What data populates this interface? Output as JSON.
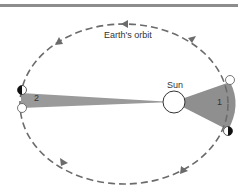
{
  "diagram": {
    "title_rule": true,
    "labels": {
      "orbit": "Earth's orbit",
      "sun": "Sun",
      "area1": "1",
      "area2": "2"
    },
    "colors": {
      "orbit": "#6b6b6b",
      "sector_fill": "#9a9a9a",
      "sun_fill": "#ffffff",
      "rule": "#8c8c8c"
    }
  }
}
